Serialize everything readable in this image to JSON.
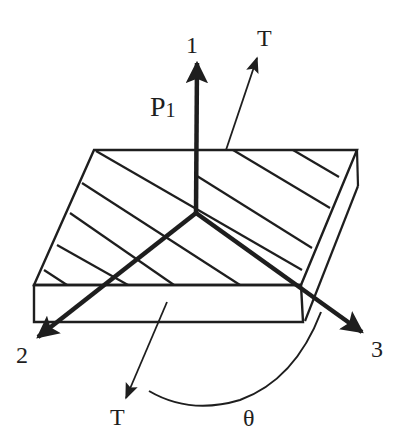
{
  "figure": {
    "width": 409,
    "height": 444,
    "colors": {
      "ink": "#1e1e1e",
      "background": "#ffffff"
    },
    "plate": {
      "top_face": [
        [
          94,
          150
        ],
        [
          357,
          150
        ],
        [
          301,
          285
        ],
        [
          34,
          285
        ]
      ],
      "front_face": [
        [
          34,
          285
        ],
        [
          301,
          285
        ],
        [
          303,
          322
        ],
        [
          34,
          322
        ]
      ],
      "side_edge_lower": [
        [
          305,
          321
        ],
        [
          358,
          186
        ]
      ],
      "side_edge_short": [
        [
          357,
          150
        ],
        [
          358,
          186
        ]
      ]
    },
    "fiber_hatch_lines": [
      [
        [
          96,
          151
        ],
        [
          302,
          270
        ]
      ],
      [
        [
          82,
          183
        ],
        [
          240,
          285
        ]
      ],
      [
        [
          70,
          213
        ],
        [
          174,
          285
        ]
      ],
      [
        [
          57,
          245
        ],
        [
          128,
          285
        ]
      ],
      [
        [
          44,
          270
        ],
        [
          67,
          285
        ]
      ],
      [
        [
          233,
          150
        ],
        [
          330,
          208
        ]
      ],
      [
        [
          293,
          150
        ],
        [
          339,
          177
        ]
      ],
      [
        [
          197,
          176
        ],
        [
          312,
          248
        ]
      ]
    ],
    "axes": {
      "origin": [
        196,
        213
      ],
      "axis_1": {
        "label": "1",
        "tip": [
          197,
          63
        ],
        "label_pos": [
          186,
          33
        ]
      },
      "axis_2": {
        "label": "2",
        "tip": [
          38,
          337
        ],
        "label_pos": [
          16,
          343
        ]
      },
      "axis_3": {
        "label": "3",
        "tip": [
          362,
          332
        ],
        "label_pos": [
          371,
          337
        ]
      }
    },
    "load": {
      "label": "P",
      "subscript": "1",
      "label_pos": [
        150,
        93
      ]
    },
    "tension_arrows": [
      {
        "label": "T",
        "from": [
          226,
          150
        ],
        "to": [
          257,
          58
        ],
        "label_pos": [
          257,
          26
        ]
      },
      {
        "label": "T",
        "from": [
          167,
          302
        ],
        "to": [
          126,
          398
        ],
        "label_pos": [
          110,
          405
        ]
      }
    ],
    "angle": {
      "label": "θ",
      "arc_path": "M149,391 Q190,415 240,400 Q295,380 321,312",
      "label_pos": [
        243,
        406
      ]
    }
  }
}
